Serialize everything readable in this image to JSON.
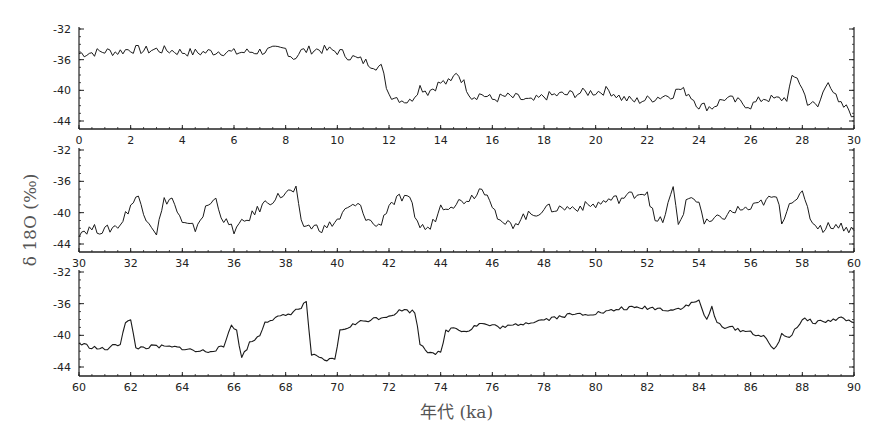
{
  "chart_data": {
    "type": "line",
    "title": "",
    "ylabel": "δ 18O (‰)",
    "xlabel": "年代 (ka)",
    "ylim": [
      -44,
      -32
    ],
    "grid": false,
    "legend": null,
    "panels": [
      {
        "xlim": [
          0,
          30
        ],
        "xticks": [
          0,
          2,
          4,
          6,
          8,
          10,
          12,
          14,
          16,
          18,
          20,
          22,
          24,
          26,
          28,
          30
        ],
        "yticks": [
          -32,
          -36,
          -40,
          -44
        ],
        "x": [
          0,
          0.5,
          1,
          1.5,
          2,
          2.5,
          3,
          3.5,
          4,
          4.5,
          5,
          5.5,
          6,
          6.5,
          7,
          7.5,
          8,
          8.3,
          8.6,
          9,
          9.5,
          10,
          10.5,
          11,
          11.5,
          11.7,
          12,
          12.5,
          12.8,
          13.2,
          13.5,
          14,
          14.4,
          14.6,
          14.8,
          15.2,
          15.6,
          16,
          16.5,
          17,
          17.5,
          18,
          18.5,
          19,
          19.5,
          20,
          20.5,
          21,
          21.5,
          22,
          22.5,
          23,
          23.2,
          23.6,
          24,
          24.5,
          25,
          25.5,
          26,
          26.5,
          27,
          27.4,
          27.6,
          27.8,
          28.2,
          28.6,
          29,
          29.4,
          29.8,
          30
        ],
        "values": [
          -35.2,
          -35.1,
          -34.9,
          -35.0,
          -34.6,
          -34.8,
          -34.7,
          -34.8,
          -35.0,
          -35.1,
          -35.0,
          -34.9,
          -35.1,
          -35.0,
          -34.9,
          -34.8,
          -34.6,
          -35.8,
          -34.9,
          -34.7,
          -34.7,
          -34.9,
          -35.6,
          -36.2,
          -36.8,
          -37.0,
          -40.5,
          -41.2,
          -41.5,
          -39.5,
          -40.2,
          -39.0,
          -39.0,
          -37.5,
          -38.5,
          -40.8,
          -40.5,
          -41.2,
          -40.8,
          -41.0,
          -41.5,
          -40.8,
          -40.6,
          -40.5,
          -40.3,
          -40.2,
          -40.0,
          -41.0,
          -41.4,
          -41.2,
          -40.8,
          -40.5,
          -39.8,
          -40.4,
          -42.0,
          -42.2,
          -41.0,
          -41.5,
          -42.0,
          -41.0,
          -41.2,
          -41.0,
          -38.6,
          -38.2,
          -41.5,
          -42.2,
          -38.5,
          -41.8,
          -42.5,
          -43.4
        ]
      },
      {
        "xlim": [
          30,
          60
        ],
        "xticks": [
          30,
          32,
          34,
          36,
          38,
          40,
          42,
          44,
          46,
          48,
          50,
          52,
          54,
          56,
          58,
          60
        ],
        "yticks": [
          -32,
          -36,
          -40,
          -44
        ],
        "x": [
          30,
          30.5,
          31,
          31.6,
          32,
          32.3,
          32.6,
          33,
          33.3,
          33.6,
          34,
          34.5,
          35,
          35.3,
          35.6,
          36,
          36.4,
          36.8,
          37.2,
          38,
          38.4,
          38.6,
          39,
          39.5,
          40,
          40.4,
          40.8,
          41.2,
          41.6,
          42,
          42.4,
          42.8,
          43.2,
          43.6,
          44,
          44.6,
          45.2,
          45.5,
          45.8,
          46.3,
          46.8,
          47.2,
          47.6,
          48,
          49,
          50,
          50.5,
          51,
          51.5,
          52,
          52.3,
          52.6,
          53,
          53.2,
          53.6,
          54,
          54.2,
          54.6,
          55,
          55.5,
          56,
          56.5,
          57,
          57.2,
          57.6,
          58,
          58.4,
          58.8,
          59.2,
          59.6,
          60
        ],
        "values": [
          -42.5,
          -42.0,
          -42.3,
          -41.5,
          -39.0,
          -38.0,
          -40.5,
          -42.5,
          -38.5,
          -38.2,
          -41.5,
          -42.0,
          -39.0,
          -38.3,
          -41.0,
          -42.2,
          -41.2,
          -40.0,
          -38.8,
          -37.5,
          -37.2,
          -41.5,
          -41.8,
          -42.0,
          -41.0,
          -39.5,
          -39.0,
          -41.0,
          -41.8,
          -39.0,
          -38.2,
          -38.5,
          -41.8,
          -42.0,
          -39.2,
          -38.8,
          -38.0,
          -37.0,
          -37.2,
          -41.5,
          -41.5,
          -40.5,
          -40.2,
          -39.5,
          -39.4,
          -39.0,
          -38.4,
          -38.2,
          -37.6,
          -37.3,
          -41.2,
          -41.0,
          -37.0,
          -41.5,
          -38.0,
          -38.5,
          -41.5,
          -41.0,
          -40.4,
          -39.6,
          -39.5,
          -38.6,
          -38.0,
          -41.0,
          -38.2,
          -37.8,
          -41.3,
          -42.0,
          -41.5,
          -41.8,
          -42.3
        ]
      },
      {
        "xlim": [
          60,
          90
        ],
        "xticks": [
          60,
          62,
          64,
          66,
          68,
          70,
          72,
          74,
          76,
          78,
          80,
          82,
          84,
          86,
          88,
          90
        ],
        "yticks": [
          -32,
          -36,
          -40,
          -44
        ],
        "x": [
          60,
          60.5,
          61,
          61.6,
          61.8,
          62,
          62.2,
          63,
          64,
          64.5,
          65,
          65.6,
          65.9,
          66.1,
          66.3,
          66.6,
          67,
          67.2,
          68,
          68.6,
          68.8,
          69,
          69.5,
          69.9,
          70.1,
          70.5,
          71,
          72,
          72.5,
          73,
          73.2,
          73.5,
          74,
          74.2,
          74.5,
          75,
          75.5,
          76,
          76.5,
          77,
          78,
          79,
          80,
          80.5,
          81,
          82,
          83,
          83.5,
          84,
          84.3,
          84.5,
          84.7,
          85,
          86,
          86.5,
          86.9,
          87.2,
          87.5,
          88,
          88.5,
          89,
          89.5,
          90
        ],
        "values": [
          -41.0,
          -41.5,
          -41.8,
          -41.0,
          -38.2,
          -38.2,
          -41.6,
          -41.4,
          -41.6,
          -42.0,
          -42.0,
          -41.5,
          -38.5,
          -39.5,
          -42.8,
          -41.0,
          -40.0,
          -38.2,
          -37.5,
          -36.5,
          -35.8,
          -42.5,
          -43.2,
          -43.0,
          -39.5,
          -38.8,
          -38.2,
          -37.5,
          -36.8,
          -37.0,
          -41.0,
          -42.0,
          -42.3,
          -39.5,
          -39.0,
          -39.5,
          -38.5,
          -38.8,
          -39.0,
          -38.6,
          -38.0,
          -37.4,
          -37.2,
          -37.0,
          -36.6,
          -36.5,
          -36.8,
          -36.3,
          -35.6,
          -38.2,
          -36.5,
          -38.5,
          -38.9,
          -39.6,
          -40.2,
          -41.8,
          -40.0,
          -40.2,
          -38.0,
          -38.3,
          -38.2,
          -37.8,
          -38.4
        ]
      }
    ]
  }
}
